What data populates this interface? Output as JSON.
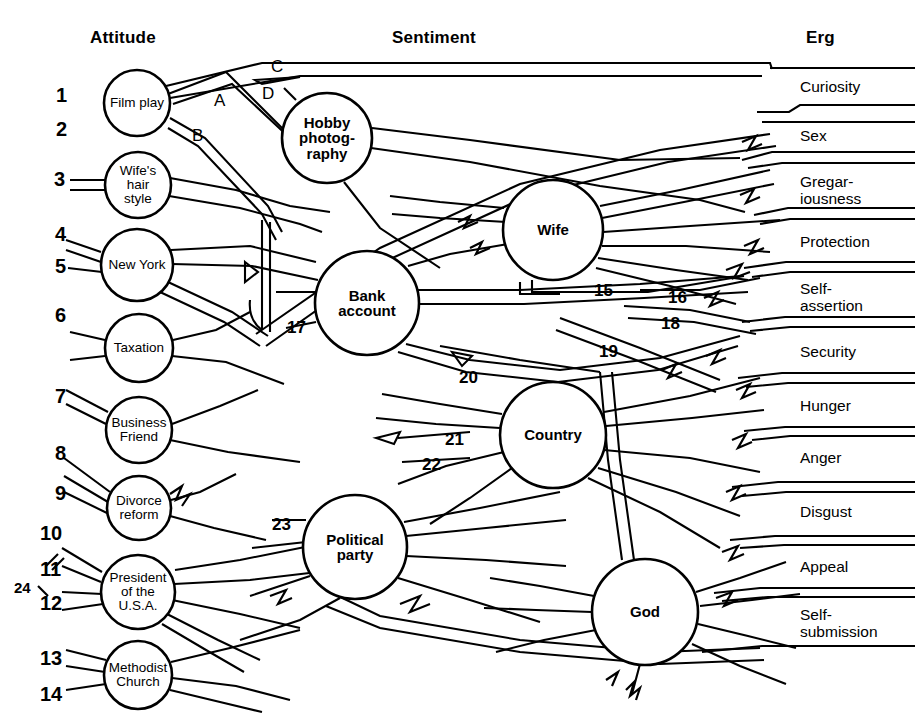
{
  "figure": {
    "background": "#ffffff",
    "ink": "#000000",
    "width": 919,
    "height": 721
  },
  "columns": {
    "attitude": {
      "label": "Attitude",
      "x": 90,
      "y": 28
    },
    "sentiment": {
      "label": "Sentiment",
      "x": 392,
      "y": 28
    },
    "erg": {
      "label": "Erg",
      "x": 806,
      "y": 28
    }
  },
  "attitude_nodes": [
    {
      "id": "film-play",
      "label": "Film play",
      "cx": 137,
      "cy": 103,
      "r": 33
    },
    {
      "id": "wifes-hair",
      "label": "Wife's\nhair\nstyle",
      "cx": 138,
      "cy": 185,
      "r": 33
    },
    {
      "id": "new-york",
      "label": "New York",
      "cx": 137,
      "cy": 265,
      "r": 36
    },
    {
      "id": "taxation",
      "label": "Taxation",
      "cx": 139,
      "cy": 348,
      "r": 34
    },
    {
      "id": "business-friend",
      "label": "Business\nFriend",
      "cx": 139,
      "cy": 430,
      "r": 33
    },
    {
      "id": "divorce-reform",
      "label": "Divorce\nreform",
      "cx": 139,
      "cy": 508,
      "r": 32
    },
    {
      "id": "president-usa",
      "label": "President\nof the\nU.S.A.",
      "cx": 138,
      "cy": 592,
      "r": 37
    },
    {
      "id": "methodist-church",
      "label": "Methodist\nChurch",
      "cx": 138,
      "cy": 675,
      "r": 34
    }
  ],
  "sentiment_nodes": [
    {
      "id": "hobby-photography",
      "label": "Hobby\nphotog-\nraphy",
      "cx": 327,
      "cy": 138,
      "r": 45
    },
    {
      "id": "wife",
      "label": "Wife",
      "cx": 553,
      "cy": 230,
      "r": 50
    },
    {
      "id": "bank-account",
      "label": "Bank\naccount",
      "cx": 367,
      "cy": 303,
      "r": 52
    },
    {
      "id": "country",
      "label": "Country",
      "cx": 553,
      "cy": 435,
      "r": 53
    },
    {
      "id": "political-party",
      "label": "Political\nparty",
      "cx": 355,
      "cy": 547,
      "r": 52
    },
    {
      "id": "god",
      "label": "God",
      "cx": 645,
      "cy": 612,
      "r": 53
    }
  ],
  "attitude_indices": [
    {
      "n": "1",
      "x": 56,
      "y": 85
    },
    {
      "n": "2",
      "x": 56,
      "y": 119
    },
    {
      "n": "3",
      "x": 54,
      "y": 169
    },
    {
      "n": "4",
      "x": 55,
      "y": 224
    },
    {
      "n": "5",
      "x": 55,
      "y": 256
    },
    {
      "n": "6",
      "x": 55,
      "y": 305
    },
    {
      "n": "7",
      "x": 55,
      "y": 386
    },
    {
      "n": "8",
      "x": 55,
      "y": 443
    },
    {
      "n": "9",
      "x": 55,
      "y": 483
    },
    {
      "n": "10",
      "x": 40,
      "y": 523
    },
    {
      "n": "11",
      "x": 40,
      "y": 559
    },
    {
      "n": "12",
      "x": 40,
      "y": 593
    },
    {
      "n": "13",
      "x": 40,
      "y": 648
    },
    {
      "n": "14",
      "x": 40,
      "y": 684
    },
    {
      "n": "24",
      "x": 14,
      "y": 580
    }
  ],
  "link_indices": [
    {
      "n": "15",
      "x": 594,
      "y": 282
    },
    {
      "n": "16",
      "x": 668,
      "y": 289
    },
    {
      "n": "17",
      "x": 287,
      "y": 319
    },
    {
      "n": "18",
      "x": 661,
      "y": 315
    },
    {
      "n": "19",
      "x": 599,
      "y": 343
    },
    {
      "n": "20",
      "x": 459,
      "y": 369
    },
    {
      "n": "21",
      "x": 445,
      "y": 431
    },
    {
      "n": "22",
      "x": 422,
      "y": 456
    },
    {
      "n": "23",
      "x": 272,
      "y": 516
    }
  ],
  "letter_labels": [
    {
      "t": "C",
      "x": 271,
      "y": 58
    },
    {
      "t": "D",
      "x": 262,
      "y": 85
    },
    {
      "t": "A",
      "x": 214,
      "y": 92
    },
    {
      "t": "B",
      "x": 192,
      "y": 127
    }
  ],
  "erg_labels": [
    {
      "id": "curiosity",
      "label": "Curiosity",
      "x": 800,
      "y": 79,
      "band_top": 68,
      "band_bottom": 115
    },
    {
      "id": "sex",
      "label": "Sex",
      "x": 800,
      "y": 128,
      "band_top": 118,
      "band_bottom": 165
    },
    {
      "id": "gregariousness",
      "label": "Gregar-\niousness",
      "x": 800,
      "y": 174,
      "band_top": 167,
      "band_bottom": 222
    },
    {
      "id": "protection",
      "label": "Protection",
      "x": 800,
      "y": 234,
      "band_top": 224,
      "band_bottom": 270
    },
    {
      "id": "self-assertion",
      "label": "Self-\nassertion",
      "x": 800,
      "y": 281,
      "band_top": 272,
      "band_bottom": 330
    },
    {
      "id": "security",
      "label": "Security",
      "x": 800,
      "y": 344,
      "band_top": 333,
      "band_bottom": 380
    },
    {
      "id": "hunger",
      "label": "Hunger",
      "x": 800,
      "y": 398,
      "band_top": 388,
      "band_bottom": 430
    },
    {
      "id": "anger",
      "label": "Anger",
      "x": 800,
      "y": 450,
      "band_top": 441,
      "band_bottom": 484
    },
    {
      "id": "disgust",
      "label": "Disgust",
      "x": 800,
      "y": 504,
      "band_top": 494,
      "band_bottom": 540
    },
    {
      "id": "appeal",
      "label": "Appeal",
      "x": 800,
      "y": 559,
      "band_top": 549,
      "band_bottom": 592
    },
    {
      "id": "self-submission",
      "label": "Self-\nsubmission",
      "x": 800,
      "y": 607,
      "band_top": 597,
      "band_bottom": 655
    }
  ]
}
